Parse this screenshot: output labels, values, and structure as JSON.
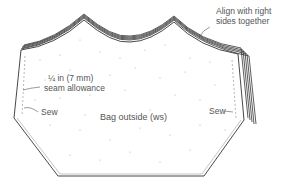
{
  "diagram": {
    "labels": {
      "align": [
        "Align with right",
        "sides together"
      ],
      "seam": [
        "¼ in (7 mm)",
        "seam allowance"
      ],
      "sew_left": "Sew",
      "sew_right": "Sew",
      "panel": "Bag outside (ws)"
    },
    "colors": {
      "outline": "#333333",
      "dashed": "#888888",
      "dots": "#aaaaaa",
      "text": "#555555"
    }
  }
}
